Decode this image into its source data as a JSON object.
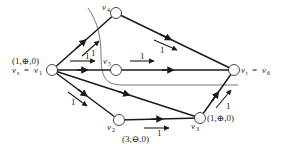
{
  "diagram": {
    "type": "flow-network",
    "nodes": [
      {
        "id": "v1",
        "label": "v",
        "sub": "1",
        "prefix": "v",
        "prefix_sub": "s",
        "x": 52,
        "y": 70,
        "full_label": "v_s = v_1",
        "annotation": "(1,⊕,0)"
      },
      {
        "id": "v2",
        "label": "v",
        "sub": "2",
        "x": 119,
        "y": 120,
        "annotation": "(3,⊖,0)"
      },
      {
        "id": "v3",
        "label": "v",
        "sub": "3",
        "x": 200,
        "y": 118,
        "annotation": "(1,⊕,0)"
      },
      {
        "id": "v4",
        "label": "v",
        "sub": "4",
        "x": 116,
        "y": 13
      },
      {
        "id": "v5",
        "label": "v",
        "sub": "5",
        "x": 116,
        "y": 70
      },
      {
        "id": "v6",
        "label": "v",
        "sub": "6",
        "prefix": "v",
        "prefix_sub": "t",
        "x": 234,
        "y": 70,
        "full_label": "v_t = v_6"
      }
    ],
    "edges": [
      {
        "from": "v1",
        "to": "v4",
        "flow": "1"
      },
      {
        "from": "v1",
        "to": "v5",
        "flow": "1"
      },
      {
        "from": "v1",
        "to": "v2",
        "flow": "1"
      },
      {
        "from": "v1",
        "to": "v3",
        "flow": ""
      },
      {
        "from": "v4",
        "to": "v6",
        "flow": "1"
      },
      {
        "from": "v5",
        "to": "v6",
        "flow": "1"
      },
      {
        "from": "v2",
        "to": "v3",
        "flow": "1"
      },
      {
        "from": "v3",
        "to": "v6",
        "flow": "1"
      }
    ],
    "labels": {
      "v1_annotation": "(1,⊕,0)",
      "v1_eq": "=",
      "v6_eq": "=",
      "v2_annotation": "(3,⊖,0)",
      "v3_annotation": "(1,⊕,0)",
      "flow_v1_v4": "1",
      "flow_v1_v5": "1",
      "flow_v1_v2": "1",
      "flow_v4_v6": "1",
      "flow_v5_v6": "1",
      "flow_v2_v3": "1",
      "flow_v3_v6": "1",
      "v": "v",
      "s": "s",
      "t": "t",
      "n1": "1",
      "n2": "2",
      "n3": "3",
      "n4": "4",
      "n5": "5",
      "n6": "6"
    },
    "cut_curve": "closed cut separating {v1, v2, v3} side from {v4, v5, v6}"
  }
}
